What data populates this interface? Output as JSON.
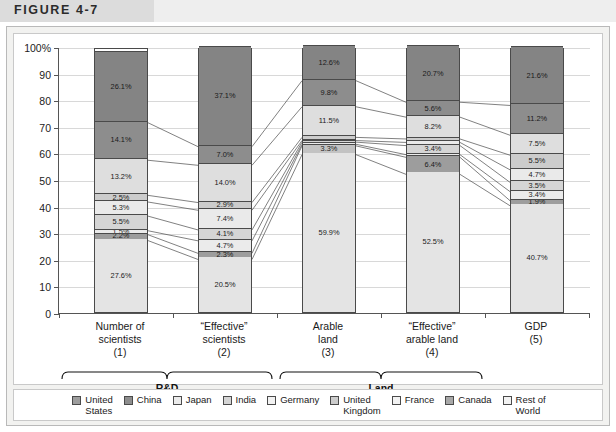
{
  "figure": {
    "label": "FIGURE 4-7"
  },
  "chart_data": {
    "type": "bar",
    "subtype": "stacked-percentage",
    "title": "",
    "xlabel": "",
    "ylabel": "",
    "ylim": [
      0,
      100
    ],
    "ytick_labels": [
      "0",
      "10",
      "20",
      "30",
      "40",
      "50",
      "60",
      "70",
      "80",
      "90",
      "100%"
    ],
    "ytick_values": [
      0,
      10,
      20,
      30,
      40,
      50,
      60,
      70,
      80,
      90,
      100
    ],
    "grid": true,
    "legend_position": "bottom",
    "categories": [
      "Number of scientists (1)",
      "“Effective” scientists (2)",
      "Arable land (3)",
      "“Effective” arable land (4)",
      "GDP (5)"
    ],
    "category_lines": [
      [
        "Number of",
        "scientists",
        "(1)"
      ],
      [
        "“Effective”",
        "scientists",
        "(2)"
      ],
      [
        "Arable",
        "land",
        "(3)"
      ],
      [
        "“Effective”",
        "arable land",
        "(4)"
      ],
      [
        "GDP",
        "(5)"
      ]
    ],
    "group_brackets": [
      {
        "label": "R&D",
        "categories": [
          0,
          1
        ]
      },
      {
        "label": "Land",
        "categories": [
          2,
          3
        ]
      }
    ],
    "series": [
      {
        "name": "United States",
        "color": "#9a9a9a",
        "values": [
          27.6,
          20.5,
          59.9,
          52.5,
          40.7
        ]
      },
      {
        "name": "China",
        "color": "#8f8f8f",
        "values": [
          2.2,
          2.3,
          1.0,
          6.4,
          1.9
        ]
      },
      {
        "name": "Japan",
        "color": "#e8e8e8",
        "values": [
          1.5,
          4.7,
          0.6,
          1.0,
          3.4
        ]
      },
      {
        "name": "India",
        "color": "#d4d4d4",
        "values": [
          5.5,
          4.1,
          0.8,
          3.4,
          3.5
        ]
      },
      {
        "name": "Germany",
        "color": "#ededed",
        "values": [
          5.3,
          7.4,
          0.6,
          1.2,
          4.7
        ]
      },
      {
        "name": "United Kingdom",
        "color": "#cfcfcf",
        "values": [
          2.5,
          2.9,
          3.3,
          1.3,
          5.5
        ]
      },
      {
        "name": "France",
        "color": "#c6c6c6",
        "values": [
          13.2,
          14.0,
          11.5,
          8.2,
          7.5
        ]
      },
      {
        "name": "Canada",
        "color": "#8a8a8a",
        "values": [
          14.1,
          7.0,
          9.8,
          5.6,
          11.2
        ]
      },
      {
        "name": "Rest of World",
        "color": "#808080",
        "values": [
          26.1,
          37.1,
          12.6,
          20.7,
          21.6
        ]
      }
    ],
    "bar_segments": [
      {
        "category": "Number of scientists (1)",
        "segments": [
          {
            "name": "United States",
            "value": 27.6,
            "label": "27.6%",
            "color": "#e4e4e4",
            "show_label": true
          },
          {
            "name": "China",
            "value": 2.2,
            "label": "2.2%",
            "color": "#9d9d9d",
            "show_label": true
          },
          {
            "name": "Japan",
            "value": 1.5,
            "label": "1.5%",
            "color": "#ebebeb",
            "show_label": true
          },
          {
            "name": "India",
            "value": 5.5,
            "label": "5.5%",
            "color": "#d5d5d5",
            "show_label": true
          },
          {
            "name": "Germany",
            "value": 5.3,
            "label": "5.3%",
            "color": "#eaeaea",
            "show_label": true
          },
          {
            "name": "United Kingdom",
            "value": 2.5,
            "label": "2.5%",
            "color": "#cccccc",
            "show_label": true
          },
          {
            "name": "France",
            "value": 13.2,
            "label": "13.2%",
            "color": "#dedede",
            "show_label": true
          },
          {
            "name": "Canada",
            "value": 14.1,
            "label": "14.1%",
            "color": "#8d8d8d",
            "show_label": true
          },
          {
            "name": "Rest of World",
            "value": 26.1,
            "label": "26.1%",
            "color": "#848484",
            "show_label": true
          }
        ]
      },
      {
        "category": "“Effective” scientists (2)",
        "segments": [
          {
            "name": "United States",
            "value": 20.5,
            "label": "20.5%",
            "color": "#e4e4e4",
            "show_label": true
          },
          {
            "name": "China",
            "value": 2.3,
            "label": "2.3%",
            "color": "#9d9d9d",
            "show_label": true
          },
          {
            "name": "Japan",
            "value": 4.7,
            "label": "4.7%",
            "color": "#ebebeb",
            "show_label": true
          },
          {
            "name": "India",
            "value": 4.1,
            "label": "4.1%",
            "color": "#d5d5d5",
            "show_label": true
          },
          {
            "name": "Germany",
            "value": 7.4,
            "label": "7.4%",
            "color": "#eaeaea",
            "show_label": true
          },
          {
            "name": "United Kingdom",
            "value": 2.9,
            "label": "2.9%",
            "color": "#cccccc",
            "show_label": true
          },
          {
            "name": "France",
            "value": 14.0,
            "label": "14.0%",
            "color": "#dedede",
            "show_label": true
          },
          {
            "name": "Canada",
            "value": 7.0,
            "label": "7.0%",
            "color": "#8d8d8d",
            "show_label": true
          },
          {
            "name": "Rest of World",
            "value": 37.1,
            "label": "37.1%",
            "color": "#848484",
            "show_label": true
          }
        ]
      },
      {
        "category": "Arable land (3)",
        "segments": [
          {
            "name": "United States",
            "value": 59.9,
            "label": "59.9%",
            "color": "#e4e4e4",
            "show_label": true
          },
          {
            "name": "China",
            "value": 3.3,
            "label": "3.3%",
            "color": "#c3c3c3",
            "show_label": true
          },
          {
            "name": "Japan",
            "value": 0.6,
            "label": "",
            "color": "#ebebeb",
            "show_label": false
          },
          {
            "name": "India",
            "value": 0.8,
            "label": "",
            "color": "#d5d5d5",
            "show_label": false
          },
          {
            "name": "Germany",
            "value": 0.6,
            "label": "",
            "color": "#eaeaea",
            "show_label": false
          },
          {
            "name": "United Kingdom",
            "value": 1.2,
            "label": "",
            "color": "#cccccc",
            "show_label": false
          },
          {
            "name": "France",
            "value": 11.5,
            "label": "11.5%",
            "color": "#dedede",
            "show_label": true
          },
          {
            "name": "Canada",
            "value": 9.8,
            "label": "9.8%",
            "color": "#8d8d8d",
            "show_label": true
          },
          {
            "name": "Rest of World",
            "value": 12.6,
            "label": "12.6%",
            "color": "#848484",
            "show_label": true
          }
        ]
      },
      {
        "category": "“Effective” arable land (4)",
        "segments": [
          {
            "name": "United States",
            "value": 52.5,
            "label": "52.5%",
            "color": "#e4e4e4",
            "show_label": true
          },
          {
            "name": "China",
            "value": 6.4,
            "label": "6.4%",
            "color": "#9d9d9d",
            "show_label": true
          },
          {
            "name": "Japan",
            "value": 1.0,
            "label": "",
            "color": "#ebebeb",
            "show_label": false
          },
          {
            "name": "India",
            "value": 3.4,
            "label": "3.4%",
            "color": "#d5d5d5",
            "show_label": true
          },
          {
            "name": "Germany",
            "value": 1.2,
            "label": "",
            "color": "#eaeaea",
            "show_label": false
          },
          {
            "name": "United Kingdom",
            "value": 1.3,
            "label": "",
            "color": "#cccccc",
            "show_label": false
          },
          {
            "name": "France",
            "value": 8.2,
            "label": "8.2%",
            "color": "#dedede",
            "show_label": true
          },
          {
            "name": "Canada",
            "value": 5.6,
            "label": "5.6%",
            "color": "#8d8d8d",
            "show_label": true
          },
          {
            "name": "Rest of World",
            "value": 20.7,
            "label": "20.7%",
            "color": "#848484",
            "show_label": true
          }
        ]
      },
      {
        "category": "GDP (5)",
        "segments": [
          {
            "name": "United States",
            "value": 40.7,
            "label": "40.7%",
            "color": "#e4e4e4",
            "show_label": true
          },
          {
            "name": "China",
            "value": 1.9,
            "label": "1.9%",
            "color": "#9d9d9d",
            "show_label": true
          },
          {
            "name": "Japan",
            "value": 3.4,
            "label": "3.4%",
            "color": "#ebebeb",
            "show_label": true
          },
          {
            "name": "India",
            "value": 3.5,
            "label": "3.5%",
            "color": "#d5d5d5",
            "show_label": true
          },
          {
            "name": "Germany",
            "value": 4.7,
            "label": "4.7%",
            "color": "#eaeaea",
            "show_label": true
          },
          {
            "name": "United Kingdom",
            "value": 5.5,
            "label": "5.5%",
            "color": "#cccccc",
            "show_label": true
          },
          {
            "name": "France",
            "value": 7.5,
            "label": "7.5%",
            "color": "#dedede",
            "show_label": true
          },
          {
            "name": "Canada",
            "value": 11.2,
            "label": "11.2%",
            "color": "#8d8d8d",
            "show_label": true
          },
          {
            "name": "Rest of World",
            "value": 21.6,
            "label": "21.6%",
            "color": "#848484",
            "show_label": true
          }
        ]
      }
    ],
    "legend": [
      {
        "label": "United States",
        "lines": [
          "United",
          "States"
        ],
        "color": "#9d9d9d"
      },
      {
        "label": "China",
        "lines": [
          "China"
        ],
        "color": "#8d8d8d"
      },
      {
        "label": "Japan",
        "lines": [
          "Japan"
        ],
        "color": "#ebebeb"
      },
      {
        "label": "India",
        "lines": [
          "India"
        ],
        "color": "#d5d5d5"
      },
      {
        "label": "Germany",
        "lines": [
          "Germany"
        ],
        "color": "#f2f2f2"
      },
      {
        "label": "United Kingdom",
        "lines": [
          "United",
          "Kingdom"
        ],
        "color": "#cccccc"
      },
      {
        "label": "France",
        "lines": [
          "France"
        ],
        "color": "#f2f2f2"
      },
      {
        "label": "Canada",
        "lines": [
          "Canada"
        ],
        "color": "#a8a8a8"
      },
      {
        "label": "Rest of World",
        "lines": [
          "Rest of",
          "World"
        ],
        "color": "#f2f2f2"
      }
    ]
  }
}
